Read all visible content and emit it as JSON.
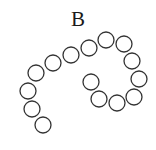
{
  "diagram": {
    "panel_label": "B",
    "stroke_color": "#333333",
    "fill_color": "#ffffff",
    "circle_radius": 8,
    "circles": [
      {
        "cx": 43,
        "cy": 125
      },
      {
        "cx": 32,
        "cy": 109
      },
      {
        "cx": 28,
        "cy": 91
      },
      {
        "cx": 36,
        "cy": 73
      },
      {
        "cx": 53,
        "cy": 63
      },
      {
        "cx": 71,
        "cy": 55
      },
      {
        "cx": 89,
        "cy": 48
      },
      {
        "cx": 106,
        "cy": 40
      },
      {
        "cx": 124,
        "cy": 44
      },
      {
        "cx": 132,
        "cy": 61
      },
      {
        "cx": 139,
        "cy": 79
      },
      {
        "cx": 134,
        "cy": 97
      },
      {
        "cx": 117,
        "cy": 103
      },
      {
        "cx": 99,
        "cy": 99
      },
      {
        "cx": 91,
        "cy": 82
      }
    ]
  }
}
